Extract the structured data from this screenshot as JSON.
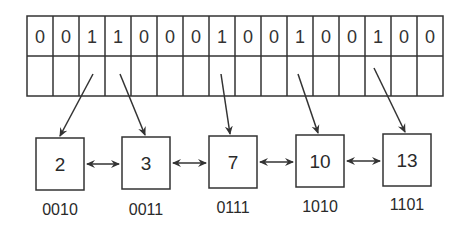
{
  "bit_array": {
    "bits": [
      "0",
      "0",
      "1",
      "1",
      "0",
      "0",
      "0",
      "1",
      "0",
      "0",
      "1",
      "0",
      "0",
      "1",
      "0",
      "0"
    ]
  },
  "nodes": [
    {
      "value": "2",
      "binary": "0010"
    },
    {
      "value": "3",
      "binary": "0011"
    },
    {
      "value": "7",
      "binary": "0111"
    },
    {
      "value": "10",
      "binary": "1010"
    },
    {
      "value": "13",
      "binary": "1101"
    }
  ],
  "colors": {
    "stroke": "#333333",
    "background": "#ffffff"
  }
}
